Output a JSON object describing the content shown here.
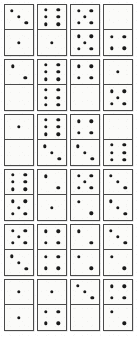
{
  "board": {
    "title": "Domino tiles grid",
    "rows": 6,
    "columns": 4,
    "tile_count": 24,
    "background_color": "#ffffff",
    "tile_face_color": "#fbfbf9",
    "tile_border_color": "#4a4a4a",
    "pip_color": "#1a1a1a"
  },
  "chart_data": {
    "type": "table",
    "xlabel": "",
    "ylabel": "",
    "categories": [
      "column 1",
      "column 2",
      "column 3",
      "column 4"
    ],
    "rows": [
      {
        "row": 1,
        "tiles": [
          {
            "top": 3,
            "bottom": 1,
            "label": "3-1",
            "top_pattern": "diagonal-3",
            "bottom_pattern": "center-1"
          },
          {
            "top": 6,
            "bottom": 1,
            "label": "6-1",
            "top_pattern": "two-columns-6",
            "bottom_pattern": "center-1"
          },
          {
            "top": 5,
            "bottom": 5,
            "label": "5-5",
            "top_pattern": "quincunx-5",
            "bottom_pattern": "quincunx-5"
          },
          {
            "top": 0,
            "bottom": 4,
            "label": "0-4",
            "top_pattern": "blank",
            "bottom_pattern": "corners-4"
          }
        ]
      },
      {
        "row": 2,
        "tiles": [
          {
            "top": 2,
            "bottom": 0,
            "label": "2-0",
            "top_pattern": "diagonal-2",
            "bottom_pattern": "blank"
          },
          {
            "top": 6,
            "bottom": 6,
            "label": "6-6",
            "top_pattern": "two-columns-6",
            "bottom_pattern": "two-columns-6"
          },
          {
            "top": 4,
            "bottom": 0,
            "label": "4-0",
            "top_pattern": "corners-4",
            "bottom_pattern": "blank"
          },
          {
            "top": 1,
            "bottom": 5,
            "label": "1-5",
            "top_pattern": "center-1",
            "bottom_pattern": "quincunx-5"
          }
        ]
      },
      {
        "row": 3,
        "tiles": [
          {
            "top": 1,
            "bottom": 0,
            "label": "1-0",
            "top_pattern": "center-1",
            "bottom_pattern": "blank"
          },
          {
            "top": 6,
            "bottom": 3,
            "label": "6-3",
            "top_pattern": "two-columns-6",
            "bottom_pattern": "diagonal-3"
          },
          {
            "top": 4,
            "bottom": 3,
            "label": "4-3",
            "top_pattern": "corners-4",
            "bottom_pattern": "diagonal-3"
          },
          {
            "top": 0,
            "bottom": 6,
            "label": "0-6",
            "top_pattern": "blank",
            "bottom_pattern": "two-columns-6"
          }
        ]
      },
      {
        "row": 4,
        "tiles": [
          {
            "top": 6,
            "bottom": 5,
            "label": "6-5",
            "top_pattern": "two-columns-6",
            "bottom_pattern": "quincunx-5"
          },
          {
            "top": 2,
            "bottom": 1,
            "label": "2-1",
            "top_pattern": "diagonal-2",
            "bottom_pattern": "center-1"
          },
          {
            "top": 5,
            "bottom": 2,
            "label": "5-2",
            "top_pattern": "quincunx-5",
            "bottom_pattern": "diagonal-2"
          },
          {
            "top": 3,
            "bottom": 3,
            "label": "3-3",
            "top_pattern": "diagonal-3",
            "bottom_pattern": "diagonal-3"
          }
        ]
      },
      {
        "row": 5,
        "tiles": [
          {
            "top": 5,
            "bottom": 3,
            "label": "5-3",
            "top_pattern": "quincunx-5",
            "bottom_pattern": "diagonal-3"
          },
          {
            "top": 4,
            "bottom": 4,
            "label": "4-4",
            "top_pattern": "corners-4",
            "bottom_pattern": "corners-4"
          },
          {
            "top": 2,
            "bottom": 2,
            "label": "2-2",
            "top_pattern": "diagonal-2",
            "bottom_pattern": "diagonal-2"
          },
          {
            "top": 3,
            "bottom": 2,
            "label": "3-2",
            "top_pattern": "diagonal-3",
            "bottom_pattern": "diagonal-2"
          }
        ]
      },
      {
        "row": 6,
        "tiles": [
          {
            "top": 1,
            "bottom": 1,
            "label": "1-1",
            "top_pattern": "center-1",
            "bottom_pattern": "center-1"
          },
          {
            "top": 1,
            "bottom": 4,
            "label": "1-4",
            "top_pattern": "center-1",
            "bottom_pattern": "corners-4"
          },
          {
            "top": 3,
            "bottom": 0,
            "label": "3-0",
            "top_pattern": "diagonal-3",
            "bottom_pattern": "blank"
          },
          {
            "top": 4,
            "bottom": 2,
            "label": "4-2",
            "top_pattern": "corners-4",
            "bottom_pattern": "diagonal-2"
          }
        ]
      }
    ]
  }
}
